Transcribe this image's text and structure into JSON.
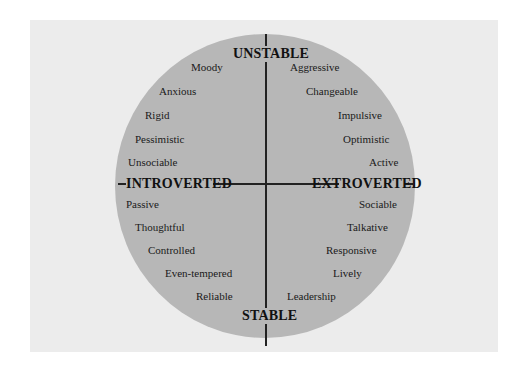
{
  "diagram": {
    "axes": {
      "top": "UNSTABLE",
      "bottom": "STABLE",
      "left": "INTROVERTED",
      "right": "EXTROVERTED"
    },
    "quadrants": {
      "unstable_introverted": [
        "Moody",
        "Anxious",
        "Rigid",
        "Pessimistic",
        "Unsociable"
      ],
      "unstable_extroverted": [
        "Aggressive",
        "Changeable",
        "Impulsive",
        "Optimistic",
        "Active"
      ],
      "stable_introverted": [
        "Passive",
        "Thoughtful",
        "Controlled",
        "Even-tempered",
        "Reliable"
      ],
      "stable_extroverted": [
        "Sociable",
        "Talkative",
        "Responsive",
        "Lively",
        "Leadership"
      ]
    },
    "colors": {
      "circle": "#b7b7b7",
      "panel": "#ececec",
      "lines": "#222222"
    }
  }
}
